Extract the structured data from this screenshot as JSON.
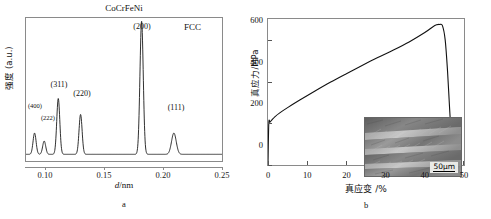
{
  "figure": {
    "panel_a_letter": "a",
    "panel_b_letter": "b"
  },
  "panel_a": {
    "title": "CoCrFeNi",
    "phase_annotation": "FCC",
    "ylabel": "强度 (a.u.)",
    "xlabel_italic": "d",
    "xlabel_rest": "/nm",
    "xticks": [
      "0.10",
      "0.15",
      "0.20",
      "0.25"
    ],
    "peak_labels": [
      "(400)",
      "(222)",
      "(311)",
      "(220)",
      "(200)",
      "(111)"
    ]
  },
  "panel_b": {
    "ylabel": "真应力/MPa",
    "xlabel": "真应变 /%",
    "yticks": [
      "0",
      "200",
      "400",
      "600"
    ],
    "xticks": [
      "0",
      "10",
      "20",
      "30",
      "40",
      "50"
    ],
    "inset": {
      "scalebar_label": "50μm"
    }
  },
  "chart_data": [
    {
      "type": "line",
      "id": "xrd-pattern",
      "title": "CoCrFeNi",
      "annotation": "FCC",
      "xlabel": "d/nm",
      "ylabel": "强度 (a.u.)",
      "xlim": [
        0.083,
        0.25
      ],
      "ylim": [
        0,
        1.0
      ],
      "grid": false,
      "legend": "none",
      "peaks": [
        {
          "hkl": "(400)",
          "d_nm": 0.0903,
          "rel_intensity": 0.16,
          "width_nm": 0.0013
        },
        {
          "hkl": "(222)",
          "d_nm": 0.0985,
          "rel_intensity": 0.1,
          "width_nm": 0.0013
        },
        {
          "hkl": "(311)",
          "d_nm": 0.1105,
          "rel_intensity": 0.42,
          "width_nm": 0.0013
        },
        {
          "hkl": "(220)",
          "d_nm": 0.1295,
          "rel_intensity": 0.3,
          "width_nm": 0.0013
        },
        {
          "hkl": "(200)",
          "d_nm": 0.1815,
          "rel_intensity": 1.0,
          "width_nm": 0.0014
        },
        {
          "hkl": "(111)",
          "d_nm": 0.209,
          "rel_intensity": 0.16,
          "width_nm": 0.002
        }
      ],
      "baseline": 0.02
    },
    {
      "type": "line",
      "id": "true-stress-strain",
      "xlabel": "真应变 /%",
      "ylabel": "真应力/MPa",
      "xlim": [
        0,
        50
      ],
      "ylim": [
        0,
        700
      ],
      "grid": false,
      "legend": "none",
      "x": [
        0,
        0.2,
        0.5,
        1.0,
        1.8,
        3,
        5,
        8,
        12,
        16,
        20,
        24,
        28,
        32,
        36,
        40,
        42,
        43,
        43.8,
        44.5,
        45.2,
        45.8,
        46.3,
        46.8,
        47.1
      ],
      "y": [
        0,
        200,
        205,
        216,
        232,
        250,
        275,
        310,
        355,
        398,
        438,
        477,
        515,
        551,
        590,
        635,
        662,
        672,
        674,
        668,
        600,
        450,
        280,
        120,
        25
      ]
    }
  ]
}
